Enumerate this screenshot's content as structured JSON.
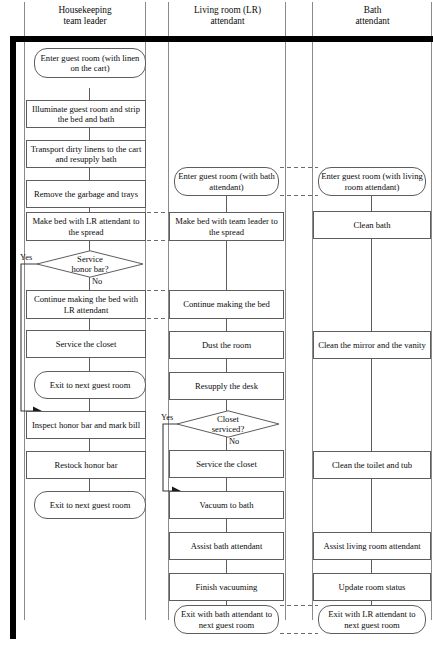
{
  "lanes": [
    {
      "id": "housekeeping",
      "label": "Housekeeping\nteam leader",
      "line1": "Housekeeping",
      "line2": "team leader"
    },
    {
      "id": "living-room",
      "label": "Living room (LR)\nattendant",
      "line1": "Living room (LR)",
      "line2": "attendant"
    },
    {
      "id": "bath",
      "label": "Bath\nattendant",
      "line1": "Bath",
      "line2": "attendant"
    }
  ],
  "colors": {
    "ink": "#0b0b0b",
    "box_border": "#5d5d5d",
    "lane_rule": "#8a8a8a",
    "thick_bar": "#000000",
    "background": "#ffffff",
    "dashed_link": "#6b6b6b"
  },
  "housekeeping_steps": [
    {
      "id": "hk-enter",
      "shape": "terminator",
      "text": "Enter guest room (with linen on the cart)"
    },
    {
      "id": "hk-illuminate",
      "shape": "process",
      "text": "Illuminate guest room and strip the bed and bath"
    },
    {
      "id": "hk-transport",
      "shape": "process",
      "text": "Transport dirty linens to the cart and resupply bath"
    },
    {
      "id": "hk-garbage",
      "shape": "process",
      "text": "Remove the garbage and trays"
    },
    {
      "id": "hk-makebed",
      "shape": "process",
      "text": "Make bed with LR attendant to the spread"
    },
    {
      "id": "hk-honorbar-decision",
      "shape": "decision",
      "text": "Service honor bar?",
      "yes_label": "Yes",
      "no_label": "No"
    },
    {
      "id": "hk-continue-bed",
      "shape": "process",
      "text": "Continue making the bed with LR attendant"
    },
    {
      "id": "hk-closet",
      "shape": "process",
      "text": "Service the closet"
    },
    {
      "id": "hk-exit-1",
      "shape": "terminator",
      "text": "Exit to next guest room"
    },
    {
      "id": "hk-inspect",
      "shape": "process",
      "text": "Inspect honor bar and mark bill"
    },
    {
      "id": "hk-restock",
      "shape": "process",
      "text": "Restock honor bar"
    },
    {
      "id": "hk-exit-2",
      "shape": "terminator",
      "text": "Exit to next guest room"
    }
  ],
  "living_room_steps": [
    {
      "id": "lr-enter",
      "shape": "terminator",
      "text": "Enter guest room (with bath attendant)"
    },
    {
      "id": "lr-makebed",
      "shape": "process",
      "text": "Make bed with team leader to the spread"
    },
    {
      "id": "lr-continue-bed",
      "shape": "process",
      "text": "Continue making the bed"
    },
    {
      "id": "lr-dust",
      "shape": "process",
      "text": "Dust the room"
    },
    {
      "id": "lr-desk",
      "shape": "process",
      "text": "Resupply the desk"
    },
    {
      "id": "lr-closet-decision",
      "shape": "decision",
      "text": "Closet serviced?",
      "yes_label": "Yes",
      "no_label": "No"
    },
    {
      "id": "lr-service-closet",
      "shape": "process",
      "text": "Service the closet"
    },
    {
      "id": "lr-vacuum-bath",
      "shape": "process",
      "text": "Vacuum to bath"
    },
    {
      "id": "lr-assist-bath",
      "shape": "process",
      "text": "Assist bath attendant"
    },
    {
      "id": "lr-finish-vacuum",
      "shape": "process",
      "text": "Finish vacuuming"
    },
    {
      "id": "lr-exit",
      "shape": "terminator",
      "text": "Exit with bath attendant to next guest room"
    }
  ],
  "bath_steps": [
    {
      "id": "ba-enter",
      "shape": "terminator",
      "text": "Enter guest room (with living room attendant)"
    },
    {
      "id": "ba-clean-bath",
      "shape": "process",
      "text": "Clean bath"
    },
    {
      "id": "ba-mirror",
      "shape": "process",
      "text": "Clean the mirror and the vanity"
    },
    {
      "id": "ba-toilet",
      "shape": "process",
      "text": "Clean the toilet and tub"
    },
    {
      "id": "ba-assist-lr",
      "shape": "process",
      "text": "Assist living room attendant"
    },
    {
      "id": "ba-update",
      "shape": "process",
      "text": "Update room status"
    },
    {
      "id": "ba-exit",
      "shape": "terminator",
      "text": "Exit with LR attendant to next guest room"
    }
  ],
  "branch_labels": {
    "honor_bar_yes": "Yes",
    "honor_bar_no": "No",
    "closet_yes": "Yes",
    "closet_no": "No"
  }
}
